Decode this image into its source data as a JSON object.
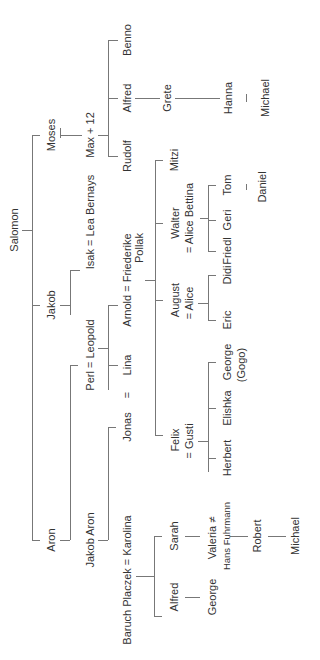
{
  "tree": {
    "root": "Salomon",
    "gen1": {
      "moses": "Moses",
      "jakob": "Jakob",
      "aron": "Aron"
    },
    "moses_line": {
      "max": "Max + 12",
      "rudolf": "Rudolf",
      "alfred": "Alfred",
      "benno": "Benno",
      "grete": "Grete",
      "hanna": "Hanna",
      "michael": "Michael"
    },
    "jakob_line": {
      "isak": "Isak = Lea Bernays",
      "perl_leopold": "Perl  =  Leopold",
      "lina": "Lina",
      "arnold": "Arnold  =  Friederike",
      "pollak": "Pollak",
      "jonas": "Jonas",
      "jonas_eq": "=",
      "felix": "Felix",
      "gusti": "= Gusti",
      "august": "August",
      "alice": "= Alice",
      "walter": "Walter",
      "alice_bettina": "= Alice Bettina",
      "mitzi": "Mitzi",
      "herbert": "Herbert",
      "elishka": "Elishka",
      "george_gogo": "George",
      "gogo": "(Gogo)",
      "eric": "Eric",
      "didi": "Didi",
      "friedl": "Friedl",
      "geri": "Geri",
      "tom": "Tom",
      "daniel": "Daniel"
    },
    "aron_line": {
      "jakob_aron": "Jakob Aron",
      "baruch": "Baruch Placzek = Karolina",
      "alfred": "Alfred",
      "sarah": "Sarah",
      "george": "George",
      "valeria": "Valeria ≠",
      "hans": "Hans Fuhrmann",
      "robert": "Robert",
      "michael": "Michael"
    }
  }
}
